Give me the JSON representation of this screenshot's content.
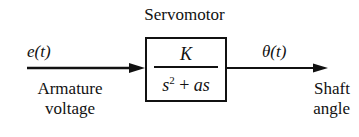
{
  "diagram": {
    "block_title": "Servomotor",
    "input": {
      "signal": "e(t)",
      "label_line1": "Armature",
      "label_line2": "voltage"
    },
    "output": {
      "signal": "θ(t)",
      "label_line1": "Shaft",
      "label_line2": "angle"
    },
    "transfer_function": {
      "numerator": "K",
      "denominator_base": "s",
      "denominator_exp": "2",
      "denominator_rest": " + ",
      "denominator_term": "as"
    }
  }
}
